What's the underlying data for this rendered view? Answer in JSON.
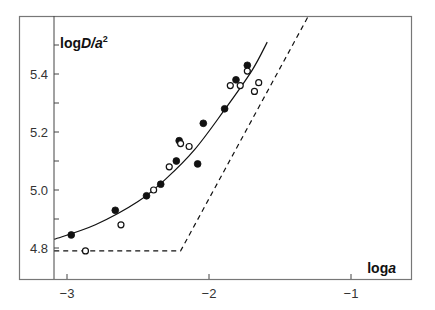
{
  "chart_data": {
    "type": "scatter",
    "title": "",
    "xlabel": "loga",
    "xlabel_parts": {
      "prefix": "log",
      "var": "a"
    },
    "ylabel": "logD/a²",
    "ylabel_parts": {
      "prefix": "log",
      "var": "D/a",
      "sup": "2"
    },
    "xlim": [
      -3.09,
      -0.41
    ],
    "ylim": [
      4.69,
      5.6
    ],
    "xticks": [
      -3,
      -2,
      -1
    ],
    "xtick_labels": [
      "−3",
      "−2",
      "−1"
    ],
    "yticks": [
      4.8,
      4.9,
      5.0,
      5.1,
      5.2,
      5.3,
      5.4,
      5.5
    ],
    "ytick_labels": {
      "4.8": "4.8",
      "5.0": "5.0",
      "5.2": "5.2",
      "5.4": "5.4"
    },
    "grid": false,
    "legend": "none",
    "series": [
      {
        "name": "filled",
        "marker": "filled-circle",
        "points": [
          [
            -2.97,
            4.845
          ],
          [
            -2.66,
            4.93
          ],
          [
            -2.44,
            4.98
          ],
          [
            -2.34,
            5.02
          ],
          [
            -2.23,
            5.1
          ],
          [
            -2.21,
            5.17
          ],
          [
            -2.08,
            5.09
          ],
          [
            -2.04,
            5.23
          ],
          [
            -1.89,
            5.28
          ],
          [
            -1.81,
            5.38
          ],
          [
            -1.73,
            5.43
          ]
        ]
      },
      {
        "name": "open",
        "marker": "open-circle",
        "points": [
          [
            -2.87,
            4.79
          ],
          [
            -2.62,
            4.88
          ],
          [
            -2.39,
            5.0
          ],
          [
            -2.28,
            5.08
          ],
          [
            -2.2,
            5.16
          ],
          [
            -2.14,
            5.15
          ],
          [
            -1.85,
            5.36
          ],
          [
            -1.78,
            5.36
          ],
          [
            -1.73,
            5.41
          ],
          [
            -1.68,
            5.34
          ],
          [
            -1.65,
            5.37
          ]
        ]
      },
      {
        "name": "fit",
        "style": "solid-line",
        "points": [
          [
            -3.09,
            4.83
          ],
          [
            -2.8,
            4.88
          ],
          [
            -2.5,
            4.96
          ],
          [
            -2.3,
            5.04
          ],
          [
            -2.1,
            5.14
          ],
          [
            -1.9,
            5.27
          ],
          [
            -1.7,
            5.41
          ],
          [
            -1.59,
            5.51
          ]
        ]
      },
      {
        "name": "limit",
        "style": "dashed-line",
        "points": [
          [
            -3.09,
            4.79
          ],
          [
            -2.2,
            4.79
          ],
          [
            -1.3,
            5.6
          ]
        ]
      }
    ]
  }
}
